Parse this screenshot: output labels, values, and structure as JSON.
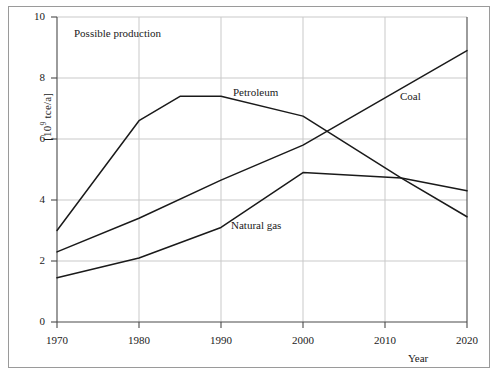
{
  "chart_data": {
    "type": "line",
    "title": "Possible production",
    "xlabel": "Year",
    "ylabel": "[10⁹ tce/a]",
    "ylabel_parts": {
      "prefix": "[10",
      "exponent": "9",
      "suffix": " tce/a]"
    },
    "xlim": [
      1970,
      2020
    ],
    "ylim": [
      0,
      10
    ],
    "xticks": [
      1970,
      1980,
      1990,
      2000,
      2010,
      2020
    ],
    "yticks": [
      0,
      2,
      4,
      6,
      8,
      10
    ],
    "grid": true,
    "legend_position": "inline-annotations",
    "series": [
      {
        "name": "Petroleum",
        "label_x": 2000,
        "x": [
          1970,
          1980,
          1985,
          1990,
          2000,
          2012,
          2020
        ],
        "values": [
          3.0,
          6.6,
          7.4,
          7.4,
          6.75,
          4.72,
          3.45
        ]
      },
      {
        "name": "Coal",
        "label_x": 2013,
        "x": [
          1970,
          1980,
          1990,
          2000,
          2020
        ],
        "values": [
          2.3,
          3.4,
          4.65,
          5.8,
          8.9
        ]
      },
      {
        "name": "Natural gas",
        "label_x": 1998,
        "x": [
          1970,
          1980,
          1990,
          2000,
          2012,
          2020
        ],
        "values": [
          1.45,
          2.1,
          3.1,
          4.9,
          4.72,
          4.3
        ]
      }
    ]
  },
  "labels": {
    "annotation": "Possible production",
    "xaxis": "Year",
    "petroleum": "Petroleum",
    "coal": "Coal",
    "natural_gas": "Natural gas"
  },
  "ticks": {
    "y": [
      "10",
      "8",
      "6",
      "4",
      "2",
      "0"
    ],
    "x": [
      "1970",
      "1980",
      "1990",
      "2000",
      "2010",
      "2020"
    ]
  },
  "colors": {
    "line": "#1a1a1a",
    "axis": "#555555",
    "grid": "#c9c9c9",
    "frame": "#9a9a9a",
    "background": "#ffffff"
  }
}
